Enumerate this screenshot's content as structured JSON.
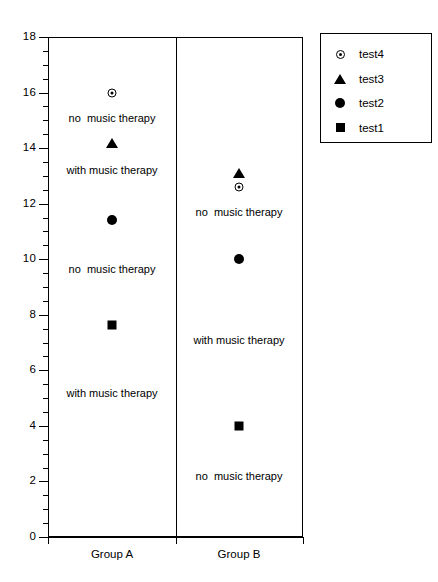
{
  "chart_data": {
    "type": "scatter",
    "title": "",
    "xlabel": "",
    "ylabel": "",
    "ylim": [
      0,
      18
    ],
    "ytick_step": 2,
    "yminor_step": 0.5,
    "grid": false,
    "legend_position": "top-right",
    "categories": [
      "Group A",
      "Group B"
    ],
    "yticks": [
      "0",
      "2",
      "4",
      "6",
      "8",
      "10",
      "12",
      "14",
      "16",
      "18"
    ],
    "series": [
      {
        "name": "test4",
        "marker": "circle-dot-icon",
        "values": [
          16.0,
          12.6
        ]
      },
      {
        "name": "test3",
        "marker": "triangle-up-icon",
        "values": [
          14.2,
          13.1
        ]
      },
      {
        "name": "test2",
        "marker": "circle-filled-icon",
        "values": [
          11.4,
          10.0
        ]
      },
      {
        "name": "test1",
        "marker": "square-filled-icon",
        "values": [
          7.65,
          4.0
        ]
      }
    ],
    "annotations": [
      {
        "group": "Group A",
        "text": "no  music therapy",
        "value": 15.1
      },
      {
        "group": "Group A",
        "text": "with music therapy",
        "value": 13.2
      },
      {
        "group": "Group A",
        "text": "no  music therapy",
        "value": 9.65
      },
      {
        "group": "Group A",
        "text": "with music therapy",
        "value": 5.2
      },
      {
        "group": "Group B",
        "text": "no  music therapy",
        "value": 11.7
      },
      {
        "group": "Group B",
        "text": "with music therapy",
        "value": 7.1
      },
      {
        "group": "Group B",
        "text": "no  music therapy",
        "value": 2.2
      }
    ]
  },
  "legend": {
    "entries": [
      {
        "label": "test4",
        "marker": "circle-dot-icon"
      },
      {
        "label": "test3",
        "marker": "triangle-up-icon"
      },
      {
        "label": "test2",
        "marker": "circle-filled-icon"
      },
      {
        "label": "test1",
        "marker": "square-filled-icon"
      }
    ]
  },
  "colors": {
    "marker": "#000000",
    "axis": "#000000",
    "background": "#ffffff"
  }
}
